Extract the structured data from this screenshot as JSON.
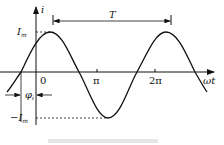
{
  "diagram": {
    "y_axis_label": "i",
    "x_axis_label": "ωt",
    "amplitude_label": "I",
    "amplitude_sub": "m",
    "neg_amplitude_label": "−I",
    "neg_amplitude_sub": "m",
    "origin_label": "0",
    "pi_label": "π",
    "two_pi_label": "2π",
    "period_label": "T",
    "phase_label": "φ",
    "phase_sub": "i",
    "colors": {
      "line": "#111111",
      "background": "#ffffff"
    }
  },
  "caption": {
    "visible": true,
    "text": ""
  }
}
